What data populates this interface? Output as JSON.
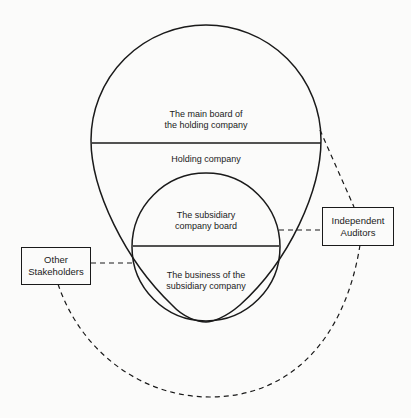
{
  "diagram": {
    "regions": {
      "main_board": {
        "line1": "The main board of",
        "line2": "the holding company"
      },
      "holding_company": {
        "label": "Holding company"
      },
      "subsidiary_board": {
        "line1": "The subsidiary",
        "line2": "company board"
      },
      "subsidiary_business": {
        "line1": "The business of the",
        "line2": "subsidiary company"
      }
    },
    "external": {
      "auditors": {
        "line1": "Independent",
        "line2": "Auditors"
      },
      "stakeholders": {
        "line1": "Other",
        "line2": "Stakeholders"
      }
    },
    "colors": {
      "stroke": "#1a1a1a",
      "background": "#fbfbfa"
    }
  }
}
